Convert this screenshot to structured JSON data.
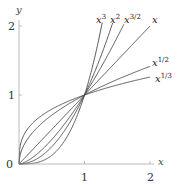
{
  "chart_data": {
    "type": "line",
    "title": "",
    "xlabel": "x",
    "ylabel": "y",
    "xlim": [
      0,
      2
    ],
    "ylim": [
      0,
      2
    ],
    "xticks": [
      "1",
      "2"
    ],
    "yticks": [
      "1",
      "2"
    ],
    "origin_label": "0",
    "grid": false,
    "legend": "inline labels at curve ends",
    "series": [
      {
        "name": "x^3",
        "label_base": "x",
        "label_exp": "3",
        "exponent": 3
      },
      {
        "name": "x^2",
        "label_base": "x",
        "label_exp": "2",
        "exponent": 2
      },
      {
        "name": "x^{3/2}",
        "label_base": "x",
        "label_exp": "3/2",
        "exponent": 1.5
      },
      {
        "name": "x",
        "label_base": "x",
        "label_exp": "",
        "exponent": 1
      },
      {
        "name": "x^{1/2}",
        "label_base": "x",
        "label_exp": "1/2",
        "exponent": 0.5
      },
      {
        "name": "x^{1/3}",
        "label_base": "x",
        "label_exp": "1/3",
        "exponent": 0.3333
      }
    ],
    "annotations": [
      "All curves pass through (0,0) and (1,1)"
    ]
  },
  "axes": {
    "x_label": "x",
    "y_label": "y",
    "origin": "0",
    "x_tick_1": "1",
    "x_tick_2": "2",
    "y_tick_1": "1",
    "y_tick_2": "2"
  },
  "labels": {
    "x3": {
      "base": "x",
      "exp": "3"
    },
    "x2": {
      "base": "x",
      "exp": "2"
    },
    "x32": {
      "base": "x",
      "exp": "3/2"
    },
    "x1": {
      "base": "x"
    },
    "x12": {
      "base": "x",
      "exp": "1/2"
    },
    "x13": {
      "base": "x",
      "exp": "1/3"
    }
  },
  "colors": {
    "axis": "#aaaaaa",
    "curve": "#444444"
  }
}
